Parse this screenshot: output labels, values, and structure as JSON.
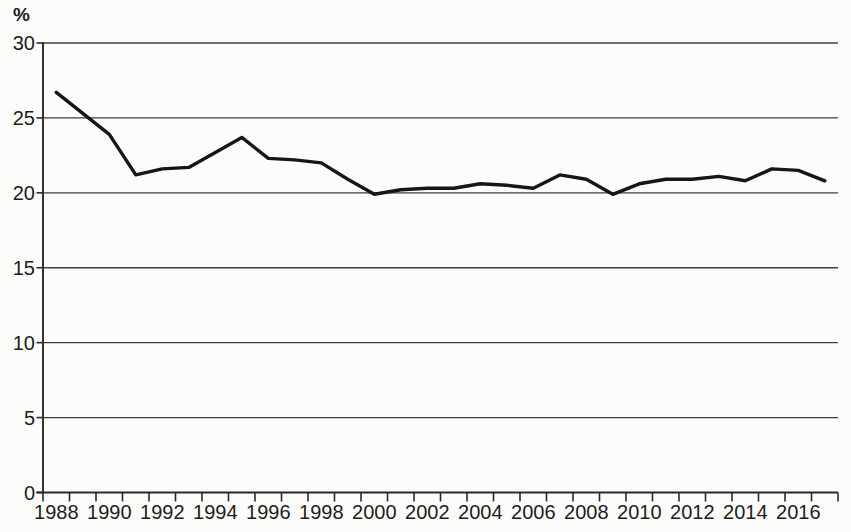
{
  "chart_data": {
    "type": "line",
    "title": "",
    "xlabel": "",
    "ylabel": "%",
    "ylim": [
      0,
      30
    ],
    "y_ticks": [
      0,
      5,
      10,
      15,
      20,
      25,
      30
    ],
    "x_tick_labels": [
      "1988",
      "1990",
      "1992",
      "1994",
      "1996",
      "1998",
      "2000",
      "2002",
      "2004",
      "2006",
      "2008",
      "2010",
      "2012",
      "2014",
      "2016"
    ],
    "categories": [
      1988,
      1989,
      1990,
      1991,
      1992,
      1993,
      1994,
      1995,
      1996,
      1997,
      1998,
      1999,
      2000,
      2001,
      2002,
      2003,
      2004,
      2005,
      2006,
      2007,
      2008,
      2009,
      2010,
      2011,
      2012,
      2013,
      2014,
      2015,
      2016,
      2017
    ],
    "series": [
      {
        "name": "percentage-share",
        "color": "#161616",
        "values": [
          26.7,
          25.3,
          23.9,
          21.2,
          21.6,
          21.7,
          22.7,
          23.7,
          22.3,
          22.2,
          22.0,
          20.9,
          19.9,
          20.2,
          20.3,
          20.3,
          20.6,
          20.5,
          20.3,
          21.2,
          20.9,
          19.9,
          20.6,
          20.9,
          20.9,
          21.1,
          20.8,
          21.6,
          21.5,
          20.8
        ]
      }
    ],
    "grid": "horizontal",
    "legend": "none",
    "colors": {
      "background": "#fcfcfb",
      "grid": "#3f3f3f",
      "axis": "#2a2a2a",
      "text": "#1c1c1c"
    }
  }
}
